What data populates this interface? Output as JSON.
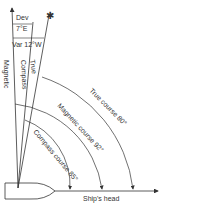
{
  "diagram": {
    "labels": {
      "dev": "Dev",
      "dev_value": "7°E",
      "var": "Var 12°W",
      "magnetic": "Magnetic",
      "compass": "Compass",
      "true": "True",
      "true_course": "True course 80°",
      "magnetic_course": "Magnetic course 92°",
      "compass_course": "Compass course 85°",
      "ships_head": "Ship's head"
    },
    "colors": {
      "line": "#333333",
      "background": "#ffffff"
    }
  }
}
